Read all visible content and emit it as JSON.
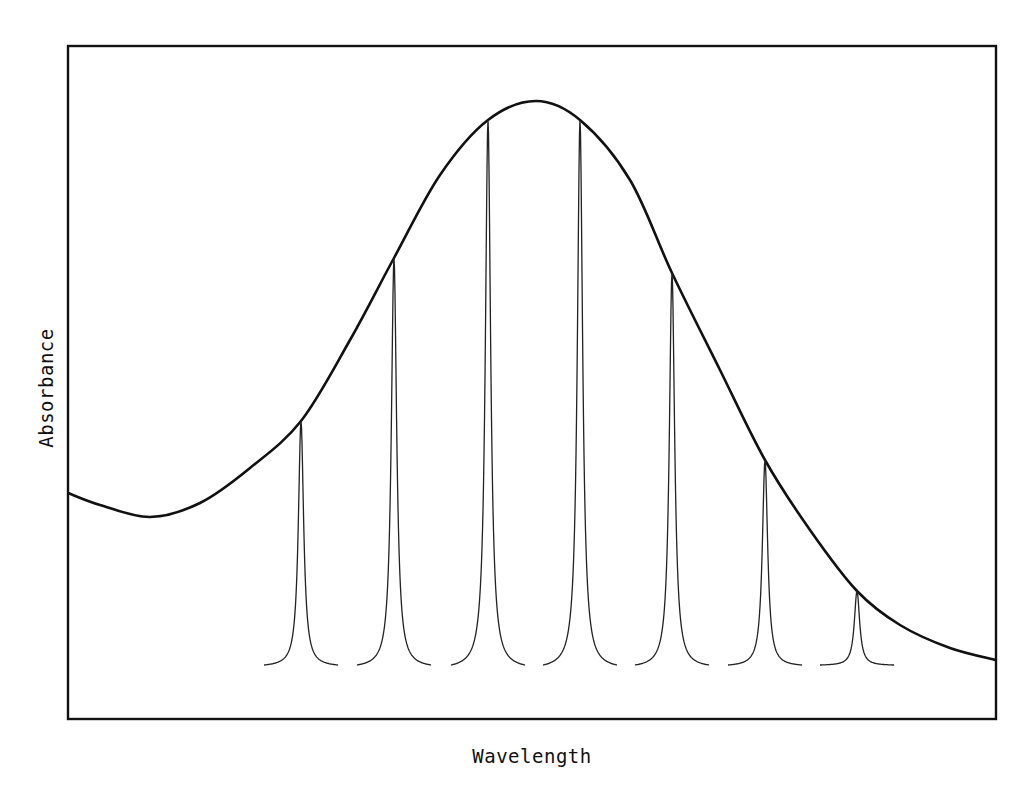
{
  "chart_data": {
    "type": "line",
    "title": "",
    "xlabel": "Wavelength",
    "ylabel": "Absorbance",
    "grid": false,
    "legend": null,
    "axes": {
      "ticks": false,
      "tick_labels": false
    },
    "series": [
      {
        "name": "Broad absorption band",
        "style": "thick",
        "points_px": [
          [
            68,
            493
          ],
          [
            100,
            505
          ],
          [
            150,
            517
          ],
          [
            200,
            503
          ],
          [
            250,
            468
          ],
          [
            301,
            421
          ],
          [
            350,
            340
          ],
          [
            394,
            258
          ],
          [
            440,
            175
          ],
          [
            488,
            120
          ],
          [
            536,
            101
          ],
          [
            580,
            120
          ],
          [
            630,
            180
          ],
          [
            672,
            273
          ],
          [
            720,
            370
          ],
          [
            765,
            460
          ],
          [
            810,
            530
          ],
          [
            857,
            591
          ],
          [
            900,
            625
          ],
          [
            950,
            648
          ],
          [
            996,
            660
          ]
        ]
      },
      {
        "name": "Narrow line components",
        "style": "thin",
        "peaks": [
          {
            "center_px": 301,
            "top_px": 421
          },
          {
            "center_px": 394,
            "top_px": 258
          },
          {
            "center_px": 488,
            "top_px": 120
          },
          {
            "center_px": 580,
            "top_px": 120
          },
          {
            "center_px": 672,
            "top_px": 273
          },
          {
            "center_px": 765,
            "top_px": 460
          },
          {
            "center_px": 857,
            "top_px": 591
          }
        ],
        "baseline_px": 665,
        "half_span_px": 37
      }
    ],
    "relative_peak_heights": [
      0.45,
      0.71,
      0.92,
      0.92,
      0.68,
      0.38,
      0.12
    ],
    "frame_px": {
      "left": 68,
      "top": 46,
      "right": 996,
      "bottom": 719
    }
  },
  "colors": {
    "line": "#111111",
    "background": "#ffffff"
  }
}
